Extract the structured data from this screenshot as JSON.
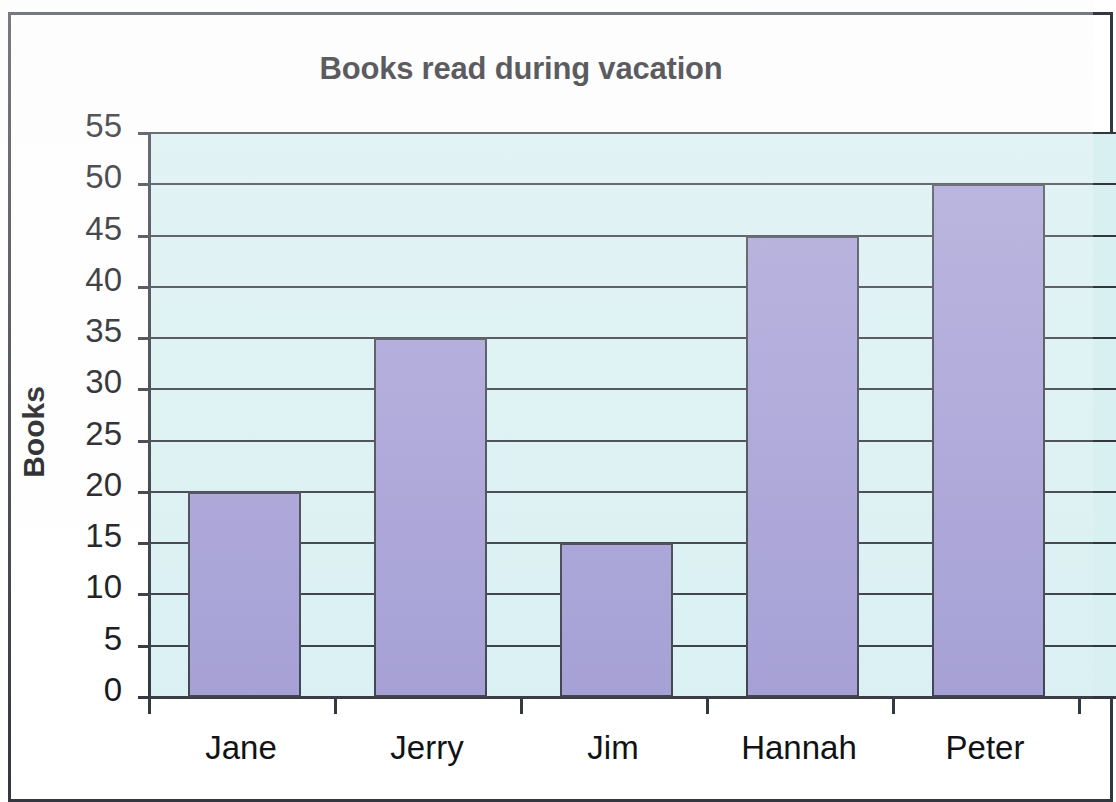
{
  "chart_data": {
    "type": "bar",
    "title": "Books read during vacation",
    "xlabel": "",
    "ylabel": "Books",
    "categories": [
      "Jane",
      "Jerry",
      "Jim",
      "Hannah",
      "Peter"
    ],
    "values": [
      20,
      35,
      15,
      45,
      50
    ],
    "series": [
      {
        "name": "Books",
        "values": [
          20,
          35,
          15,
          45,
          50
        ]
      }
    ],
    "ylim": [
      0,
      55
    ],
    "ytick_step": 5,
    "ytick_labels": [
      "55",
      "50",
      "45",
      "40",
      "35",
      "30",
      "25",
      "20",
      "15",
      "10",
      "5",
      "0"
    ],
    "grid": true,
    "grid_axis": "y",
    "legend": false,
    "legend_position": "none",
    "cropped_right": true,
    "colors": {
      "bar_fill": "#a39dd4",
      "bar_border": "#3b3f4a",
      "plot_background": "#d9f0f2",
      "gridline": "#32363e",
      "axis": "#2d3139",
      "text": "#0e0f13",
      "frame_border": "#33373f",
      "page_background": "#ffffff"
    }
  }
}
